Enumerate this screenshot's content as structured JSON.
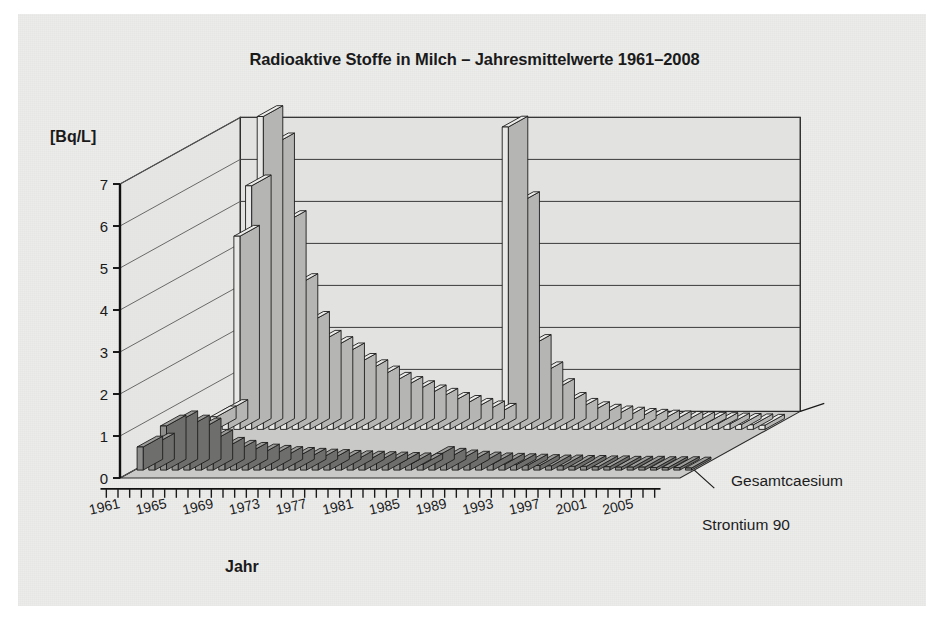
{
  "figure": {
    "title": "Radioaktive Stoffe in Milch – Jahresmittelwerte 1961–2008",
    "ylabel": "[Bq/L]",
    "xlabel": "Jahr",
    "series_label_back": "Gesamtcaesium",
    "series_label_front": "Strontium 90",
    "colors": {
      "paper": "#ececeb",
      "floor": "#c9c9c7",
      "wall": "#e2e2e0",
      "bar_back": "#e8e8e6",
      "bar_front": "#8d8d8b",
      "ink": "#1a1a1a"
    }
  },
  "chart_data": {
    "type": "bar",
    "title": "Radioaktive Stoffe in Milch – Jahresmittelwerte 1961–2008",
    "xlabel": "Jahr",
    "ylabel": "[Bq/L]",
    "ylim": [
      0,
      7
    ],
    "yticks": [
      0,
      1,
      2,
      3,
      4,
      5,
      6,
      7
    ],
    "grid": true,
    "legend_position": "right-inline-3d",
    "projection": "3d-two-row",
    "categories": [
      1961,
      1962,
      1963,
      1964,
      1965,
      1966,
      1967,
      1968,
      1969,
      1970,
      1971,
      1972,
      1973,
      1974,
      1975,
      1976,
      1977,
      1978,
      1979,
      1980,
      1981,
      1982,
      1983,
      1984,
      1985,
      1986,
      1987,
      1988,
      1989,
      1990,
      1991,
      1992,
      1993,
      1994,
      1995,
      1996,
      1997,
      1998,
      1999,
      2000,
      2001,
      2002,
      2003,
      2004,
      2005,
      2006,
      2007,
      2008
    ],
    "xtick_labels": [
      1961,
      1965,
      1969,
      1973,
      1977,
      1981,
      1985,
      1989,
      1993,
      1997,
      2001,
      2005
    ],
    "series": [
      {
        "name": "Gesamtcaesium",
        "values": [
          0.3,
          0.45,
          4.6,
          5.8,
          7.45,
          6.8,
          4.95,
          3.45,
          2.55,
          2.1,
          1.95,
          1.8,
          1.55,
          1.4,
          1.25,
          1.1,
          1.0,
          0.9,
          0.8,
          0.72,
          0.62,
          0.55,
          0.48,
          0.42,
          0.36,
          7.2,
          5.4,
          2.0,
          1.35,
          0.95,
          0.62,
          0.48,
          0.4,
          0.34,
          0.3,
          0.27,
          0.24,
          0.22,
          0.2,
          0.18,
          0.17,
          0.16,
          0.15,
          0.14,
          0.13,
          0.12,
          0.11,
          0.1
        ]
      },
      {
        "name": "Strontium 90",
        "values": [
          0.55,
          0.62,
          1.05,
          1.15,
          1.05,
          0.98,
          0.7,
          0.52,
          0.45,
          0.4,
          0.36,
          0.33,
          0.3,
          0.28,
          0.26,
          0.24,
          0.23,
          0.21,
          0.2,
          0.19,
          0.18,
          0.17,
          0.16,
          0.15,
          0.14,
          0.3,
          0.26,
          0.22,
          0.19,
          0.17,
          0.15,
          0.14,
          0.13,
          0.12,
          0.11,
          0.1,
          0.1,
          0.09,
          0.09,
          0.08,
          0.08,
          0.07,
          0.07,
          0.07,
          0.06,
          0.06,
          0.06,
          0.05
        ]
      }
    ]
  }
}
